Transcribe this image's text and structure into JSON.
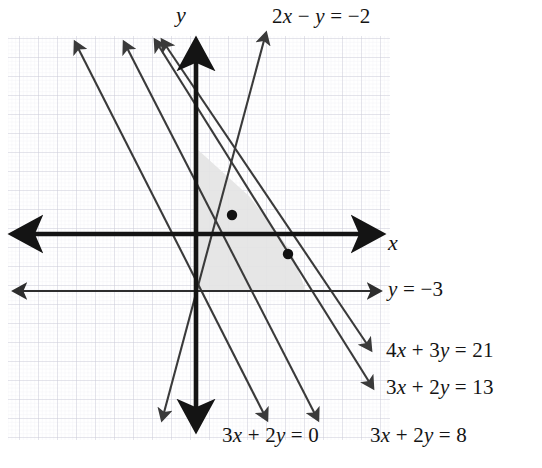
{
  "figure": {
    "kind": "coordinate-plane-linear-inequalities",
    "width": 542,
    "height": 468,
    "background_color": "#ffffff"
  },
  "axes": {
    "x_label": "x",
    "y_label": "y",
    "origin_px": [
      196,
      234
    ],
    "unit_px": 19,
    "axis_color": "#141414",
    "x_axis": {
      "from_px": [
        8,
        234
      ],
      "to_px": [
        384,
        234
      ],
      "arrows": "both"
    },
    "y_axis": {
      "from_px": [
        196,
        36
      ],
      "to_px": [
        196,
        434
      ],
      "arrows": "both"
    }
  },
  "grid": {
    "visible": true,
    "minor_spacing_px": 3.8,
    "major_spacing_px": 19,
    "minor_color": "#e9e9ef",
    "major_color": "#c9c9d6",
    "extent_px": {
      "left": 8,
      "top": 36,
      "right": 390,
      "bottom": 440
    }
  },
  "region": {
    "label": "feasible-region",
    "fill_color": "#e4e4e4",
    "opacity": 0.85,
    "vertices_px": [
      [
        196,
        148
      ],
      [
        196,
        291
      ],
      [
        306,
        291
      ],
      [
        291,
        251
      ],
      [
        249,
        196
      ]
    ]
  },
  "chart_data": {
    "type": "line",
    "title": "",
    "xlabel": "x",
    "ylabel": "y",
    "xlim": [
      -10,
      10
    ],
    "ylim": [
      -10.5,
      10.5
    ],
    "grid": true,
    "legend": "inline-labels",
    "series": [
      {
        "name": "2x - y = -2",
        "label": "2x &minus; y = &minus;2",
        "slope": 2,
        "intercept": 2,
        "pixels": {
          "from": [
            162,
            420
          ],
          "to": [
            266,
            33
          ]
        },
        "arrows": "both"
      },
      {
        "name": "3x + 2y = 0",
        "label": "3x + 2y = 0",
        "slope": -1.5,
        "intercept": 0,
        "pixels": {
          "from": [
            75,
            42
          ],
          "to": [
            267,
            420
          ]
        },
        "arrows": "both"
      },
      {
        "name": "3x + 2y = 8",
        "label": "3x + 2y = 8",
        "slope": -1.5,
        "intercept": 4,
        "pixels": {
          "from": [
            124,
            42
          ],
          "to": [
            318,
            420
          ]
        },
        "arrows": "both"
      },
      {
        "name": "3x + 2y = 13",
        "label": "3x + 2y = 13",
        "slope": -1.5,
        "intercept": 6.5,
        "pixels": {
          "from": [
            155,
            40
          ],
          "to": [
            373,
            388
          ]
        },
        "arrows": "both"
      },
      {
        "name": "4x + 3y = 21",
        "label": "4x + 3y = 21",
        "slope": -1.3333,
        "intercept": 7,
        "pixels": {
          "from": [
            162,
            40
          ],
          "to": [
            371,
            350
          ]
        },
        "arrows": "both"
      },
      {
        "name": "y = -3",
        "label": "y = &minus;3",
        "slope": 0,
        "intercept": -3,
        "pixels": {
          "from": [
            8,
            291
          ],
          "to": [
            380,
            291
          ]
        },
        "arrows": "both"
      }
    ],
    "points": [
      {
        "name": "vertex-a",
        "pixels": [
          232,
          215
        ],
        "x": 1.9,
        "y": 1.0
      },
      {
        "name": "vertex-b",
        "pixels": [
          288,
          254
        ],
        "x": 4.8,
        "y": -1.05
      }
    ]
  },
  "labels": {
    "top_line": "2x − y = −2",
    "y_equals_minus3": "y = −3",
    "four_x_three_y_21": "4x + 3y = 21",
    "three_x_two_y_13": "3x + 2y = 13",
    "three_x_two_y_0": "3x + 2y = 0",
    "three_x_two_y_8": "3x + 2y = 8",
    "axis_x": "x",
    "axis_y": "y"
  },
  "colors": {
    "line": "#3a3a3a",
    "axis": "#141414",
    "shade": "#e4e4e4",
    "point": "#111111",
    "grid_minor": "#e9e9ef",
    "grid_major": "#c9c9d6"
  }
}
